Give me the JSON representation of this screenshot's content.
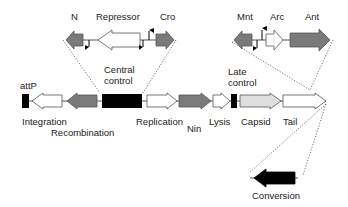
{
  "colors": {
    "dark_gray": "#7a7a7a",
    "light_gray": "#dedede",
    "white": "#ffffff",
    "black": "#000000",
    "outline": "#555555"
  },
  "labels": {
    "n": "N",
    "repressor": "Repressor",
    "cro": "Cro",
    "mnt": "Mnt",
    "arc": "Arc",
    "ant": "Ant",
    "attp": "attP",
    "central_control_1": "Central",
    "central_control_2": "control",
    "late_control_1": "Late",
    "late_control_2": "control",
    "integration": "Integration",
    "recombination": "Recombination",
    "replication": "Replication",
    "nin": "Nin",
    "lysis": "Lysis",
    "capsid": "Capsid",
    "tail": "Tail",
    "conversion": "Conversion"
  },
  "genome_map": {
    "main_row": [
      {
        "name": "attP",
        "shape": "box",
        "fill": "black",
        "x": 23,
        "w": 6
      },
      {
        "name": "Integration",
        "shape": "arrow-left",
        "fill": "white",
        "x": 31,
        "w": 32
      },
      {
        "name": "Recombination",
        "shape": "arrow-left",
        "fill": "dark_gray",
        "x": 67,
        "w": 30
      },
      {
        "name": "Central control",
        "shape": "box",
        "fill": "black",
        "x": 102,
        "w": 40
      },
      {
        "name": "Replication",
        "shape": "arrow-right",
        "fill": "white",
        "x": 147,
        "w": 30
      },
      {
        "name": "Nin",
        "shape": "arrow-right",
        "fill": "dark_gray",
        "x": 179,
        "w": 32
      },
      {
        "name": "Lysis",
        "shape": "arrow-right",
        "fill": "white",
        "x": 213,
        "w": 17
      },
      {
        "name": "Late control",
        "shape": "box",
        "fill": "black",
        "x": 231,
        "w": 6
      },
      {
        "name": "Capsid",
        "shape": "arrow-right",
        "fill": "light_gray",
        "x": 240,
        "w": 41
      },
      {
        "name": "Tail",
        "shape": "arrow-right",
        "fill": "white",
        "x": 283,
        "w": 43
      }
    ],
    "insets": [
      {
        "name": "Immunity region",
        "genes": [
          "N",
          "Repressor",
          "Cro"
        ]
      },
      {
        "name": "Antirepressor region",
        "genes": [
          "Mnt",
          "Arc",
          "Ant"
        ]
      },
      {
        "name": "Conversion region",
        "genes": [
          "Conversion"
        ]
      }
    ]
  }
}
